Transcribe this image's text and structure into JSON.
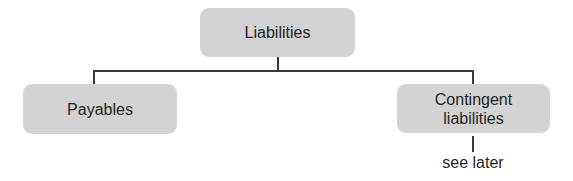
{
  "diagram": {
    "type": "hierarchy-tree",
    "root": {
      "label": "Liabilities"
    },
    "children": [
      {
        "label": "Payables"
      },
      {
        "label": "Contingent liabilities",
        "note": "see later"
      }
    ],
    "colors": {
      "node_fill": "#d3d3d3",
      "connector": "#3a3a3a",
      "text": "#1f1f1f",
      "background": "#ffffff"
    }
  }
}
